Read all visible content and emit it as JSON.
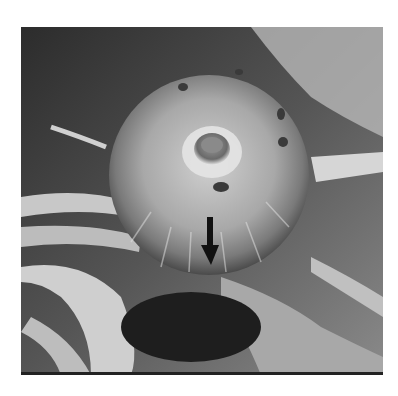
{
  "figure": {
    "annotation": {
      "type": "arrow",
      "direction": "down",
      "color": "#111111"
    },
    "colors": {
      "background": "#ffffff",
      "photo_dark": "#2a2a2a",
      "photo_light": "#d8d8d8"
    }
  }
}
